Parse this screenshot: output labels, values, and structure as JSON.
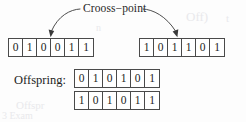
{
  "figure": {
    "type": "genetic-algorithm-crossover-diagram",
    "crossover_label": "Crooss−point",
    "offspring_label": "Offspring:",
    "parents": [
      {
        "name": "parent-a",
        "bits": [
          "0",
          "1",
          "0",
          "0",
          "1",
          "1"
        ]
      },
      {
        "name": "parent-b",
        "bits": [
          "1",
          "0",
          "1",
          "1",
          "0",
          "1"
        ]
      }
    ],
    "offspring": [
      {
        "name": "child-a",
        "bits": [
          "0",
          "1",
          "0",
          "1",
          "0",
          "1"
        ]
      },
      {
        "name": "child-b",
        "bits": [
          "1",
          "0",
          "1",
          "0",
          "1",
          "1"
        ]
      }
    ],
    "annotations": {
      "left_arrow": "curved-arrow-pointing-to-left-parent-crossover-site",
      "right_arrow": "curved-arrow-pointing-to-right-parent-crossover-site"
    },
    "colors": {
      "page_background": "#fdfdfd",
      "cell_border": "#4a4a4a",
      "text": "#1c1c1c",
      "arrow": "#3a3a3a",
      "ghost": "#e9e9ec"
    },
    "ghost_artifacts": [
      {
        "text": "Off)",
        "left": 186,
        "top": 9,
        "size": 13
      },
      {
        "text": "t",
        "left": 226,
        "top": 12,
        "size": 11
      },
      {
        "text": "Offspr",
        "left": 16,
        "top": 99,
        "size": 11
      },
      {
        "text": "3 Exam",
        "left": 2,
        "top": 110,
        "size": 10
      },
      {
        "text": "n",
        "left": 96,
        "top": 22,
        "size": 10
      }
    ]
  }
}
